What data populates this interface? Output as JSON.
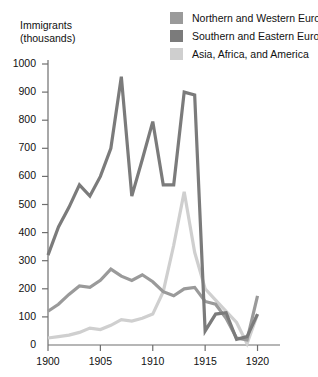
{
  "axis_title": {
    "line1": "Immigrants",
    "line2": "(thousands)"
  },
  "legend": {
    "items": [
      {
        "label": "Northern and Western Europe",
        "color": "#9a9a9a",
        "swatch_name": "legend-swatch-northern-western-europe"
      },
      {
        "label": "Southern and Eastern Europe",
        "color": "#7b7b7b",
        "swatch_name": "legend-swatch-southern-eastern-europe"
      },
      {
        "label": "Asia, Africa, and America",
        "color": "#cfcfcf",
        "swatch_name": "legend-swatch-asia-africa-america"
      }
    ]
  },
  "chart_data": {
    "type": "line",
    "title": "",
    "xlabel": "",
    "ylabel": "Immigrants (thousands)",
    "xlim": [
      1900,
      1921
    ],
    "ylim": [
      0,
      1000
    ],
    "grid": false,
    "legend_position": "top-right",
    "x_ticks": [
      "1900",
      "1905",
      "1910",
      "1915",
      "1920"
    ],
    "x_tick_values": [
      1900,
      1905,
      1910,
      1915,
      1920
    ],
    "y_ticks": [
      "0",
      "100",
      "200",
      "300",
      "400",
      "500",
      "600",
      "700",
      "800",
      "900",
      "1000"
    ],
    "y_tick_values": [
      0,
      100,
      200,
      300,
      400,
      500,
      600,
      700,
      800,
      900,
      1000
    ],
    "x": [
      1900,
      1901,
      1902,
      1903,
      1904,
      1905,
      1906,
      1907,
      1908,
      1909,
      1910,
      1911,
      1912,
      1913,
      1914,
      1915,
      1916,
      1917,
      1918,
      1919,
      1920
    ],
    "series": [
      {
        "name": "Northern and Western Europe",
        "color": "#9a9a9a",
        "values": [
          120,
          145,
          180,
          210,
          205,
          230,
          270,
          245,
          230,
          250,
          225,
          190,
          175,
          200,
          205,
          155,
          145,
          95,
          25,
          18,
          175
        ]
      },
      {
        "name": "Southern and Eastern Europe",
        "color": "#7b7b7b",
        "values": [
          320,
          420,
          490,
          570,
          530,
          600,
          700,
          955,
          530,
          660,
          795,
          570,
          570,
          900,
          890,
          50,
          110,
          115,
          20,
          30,
          110
        ]
      },
      {
        "name": "Asia, Africa, and America",
        "color": "#cfcfcf",
        "values": [
          25,
          30,
          35,
          45,
          60,
          55,
          70,
          90,
          85,
          95,
          110,
          190,
          355,
          545,
          330,
          200,
          160,
          120,
          80,
          5,
          110
        ]
      }
    ]
  }
}
